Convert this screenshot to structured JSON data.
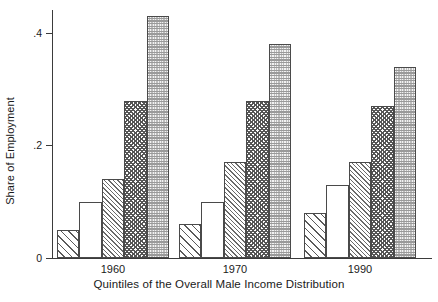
{
  "chart_data": {
    "type": "bar",
    "title": "",
    "xlabel": "Quintiles of the Overall Male Income Distribution",
    "ylabel": "Share of Employment",
    "categories": [
      "1960",
      "1970",
      "1990"
    ],
    "ylim": [
      0,
      0.45
    ],
    "yticks": [
      0,
      0.2,
      0.4
    ],
    "ytick_labels": [
      "0",
      ".2",
      ".4"
    ],
    "grid": false,
    "legend": "none",
    "series": [
      {
        "name": "Quintile 1",
        "pattern": "diagonal-hatch-wide",
        "values": [
          0.05,
          0.06,
          0.08
        ]
      },
      {
        "name": "Quintile 2",
        "pattern": "empty-white",
        "values": [
          0.1,
          0.1,
          0.13
        ]
      },
      {
        "name": "Quintile 3",
        "pattern": "diagonal-hatch-dense",
        "values": [
          0.14,
          0.17,
          0.17
        ]
      },
      {
        "name": "Quintile 4",
        "pattern": "crosshatch",
        "values": [
          0.28,
          0.28,
          0.27
        ]
      },
      {
        "name": "Quintile 5",
        "pattern": "stipple-dots",
        "values": [
          0.43,
          0.38,
          0.34
        ]
      }
    ]
  },
  "axes": {
    "ylabel": "Share of Employment",
    "xlabel": "Quintiles of the Overall Male Income Distribution",
    "ytick_0": "0",
    "ytick_1": ".2",
    "ytick_2": ".4",
    "group_0": "1960",
    "group_1": "1970",
    "group_2": "1990"
  },
  "colors": {
    "axis": "#3b3b3b",
    "bar_outline": "#4a4a4a",
    "background": "#ffffff",
    "text": "#1a1a1a"
  }
}
